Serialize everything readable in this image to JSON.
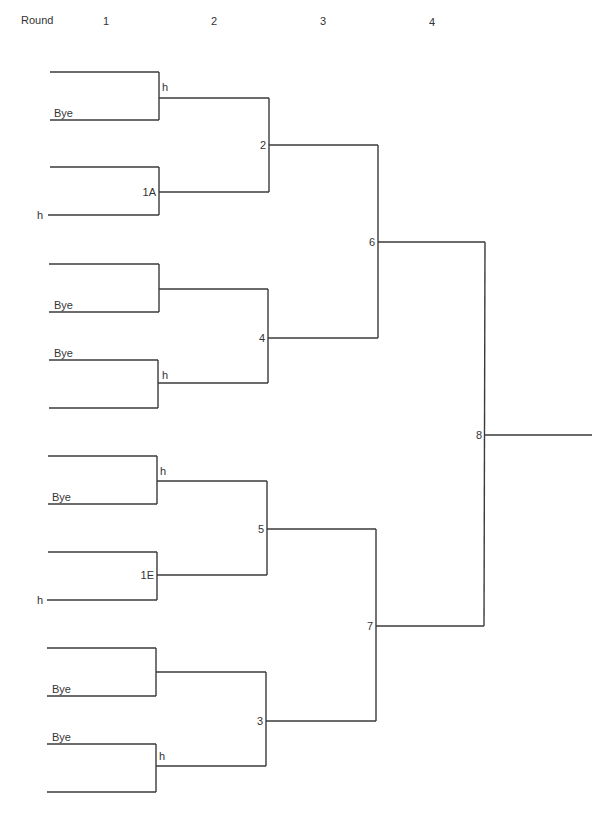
{
  "header": {
    "round_label": "Round",
    "rounds": [
      "1",
      "2",
      "3",
      "4"
    ]
  },
  "bracket": {
    "line_color": "#3a3a3a",
    "round1_matches": [
      {
        "top_entry": "",
        "bottom_entry": "Bye",
        "winner_label": "h"
      },
      {
        "top_entry": "",
        "bottom_entry": "h",
        "winner_label": "1A"
      },
      {
        "top_entry": "",
        "bottom_entry": "Bye",
        "winner_label": ""
      },
      {
        "top_entry": "Bye",
        "bottom_entry": "",
        "winner_label": "h"
      },
      {
        "top_entry": "",
        "bottom_entry": "Bye",
        "winner_label": "h"
      },
      {
        "top_entry": "",
        "bottom_entry": "h",
        "winner_label": "1E"
      },
      {
        "top_entry": "",
        "bottom_entry": "Bye",
        "winner_label": ""
      },
      {
        "top_entry": "Bye",
        "bottom_entry": "",
        "winner_label": "h"
      }
    ],
    "round2_matches": [
      "2",
      "4",
      "5",
      "3"
    ],
    "round3_matches": [
      "6",
      "7"
    ],
    "round4_matches": [
      "8"
    ]
  }
}
